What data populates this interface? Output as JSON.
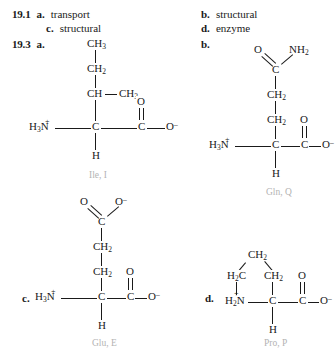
{
  "answers_191": {
    "number": "19.1",
    "items": [
      {
        "label": "a.",
        "text": "transport"
      },
      {
        "label": "b.",
        "text": "structural"
      },
      {
        "label": "c.",
        "text": "structural"
      },
      {
        "label": "d.",
        "text": "enzyme"
      }
    ]
  },
  "answers_193": {
    "number": "19.3",
    "items": [
      {
        "label": "a.",
        "name": "Ile, I"
      },
      {
        "label": "b.",
        "name": "Gln, Q"
      },
      {
        "label": "c.",
        "name": "Glu, E"
      },
      {
        "label": "d.",
        "name": "Pro, P"
      }
    ]
  },
  "ile": {
    "ch3_top": "CH3",
    "ch2": "CH2",
    "ch": "CH",
    "ch3_right": "CH3",
    "n": "H3N",
    "ca": "C",
    "ccarb": "C",
    "o_double": "O",
    "o_minus": "O",
    "o_minus_sup": "–",
    "h": "H",
    "n_plus": "+",
    "label": "Ile, I"
  },
  "gln": {
    "o_amide": "O",
    "nh2": "NH2",
    "c_amide": "C",
    "ch2_upper": "CH2",
    "ch2_lower": "CH2",
    "n": "H3N",
    "ca": "C",
    "ccarb": "C",
    "o_double": "O",
    "o_minus": "O",
    "o_minus_sup": "–",
    "h": "H",
    "n_plus": "+",
    "label": "Gln, Q"
  },
  "glu": {
    "o_double_side": "O",
    "o_minus_side": "O",
    "o_minus_side_sup": "–",
    "c_side": "C",
    "ch2_upper": "CH2",
    "ch2_lower": "CH2",
    "n": "H3N",
    "ca": "C",
    "ccarb": "C",
    "o_double": "O",
    "o_minus": "O",
    "o_minus_sup": "–",
    "h": "H",
    "n_plus": "+",
    "label": "Glu, E"
  },
  "pro": {
    "ch2_top": "CH2",
    "h2c_left": "H2C",
    "ch2_right": "CH2",
    "n": "H2N",
    "ca": "C",
    "ccarb": "C",
    "o_double": "O",
    "o_minus": "O",
    "o_minus_sup": "–",
    "h": "H",
    "n_plus": "+",
    "label": "Pro, P"
  },
  "colors": {
    "ink": "#1a1a1a",
    "name_gray": "#b3b3b3"
  }
}
